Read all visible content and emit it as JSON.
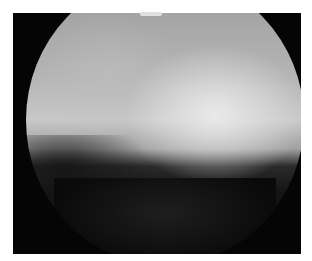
{
  "image": {
    "description": "Grayscale arthroscopic/endoscopic view within a circular field of view on a black frame",
    "colors": {
      "frame": "#050505",
      "border": "#ffffff",
      "tissue_bright": "#e6e6e6",
      "tissue_mid": "#a8a8a8",
      "shadow": "#141414"
    }
  }
}
